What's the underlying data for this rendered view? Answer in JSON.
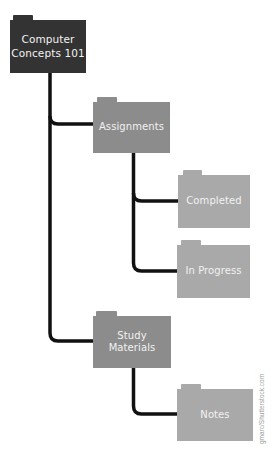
{
  "diagram": {
    "type": "folder-tree",
    "colors": {
      "root": "#333333",
      "mid": "#8c8c8c",
      "leaf": "#a9a9a9",
      "connector": "#111111",
      "background": "#ffffff"
    },
    "root": {
      "label_line1": "Computer",
      "label_line2": "Concepts 101"
    },
    "children": [
      {
        "label": "Assignments",
        "children": [
          {
            "label": "Completed"
          },
          {
            "label": "In Progress"
          }
        ]
      },
      {
        "label_line1": "Study",
        "label_line2": "Materials",
        "children": [
          {
            "label": "Notes"
          }
        ]
      }
    ]
  },
  "credit": "gmarc/Shutterstock.com"
}
